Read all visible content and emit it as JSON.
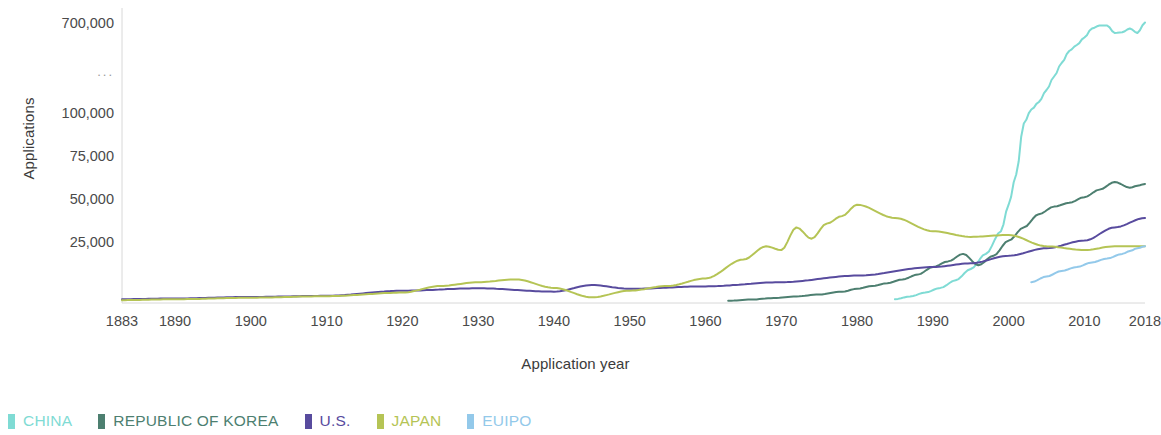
{
  "chart_data": {
    "type": "line",
    "title": "",
    "xlabel": "Application year",
    "ylabel": "Applications",
    "xlim": [
      1883,
      2018
    ],
    "ylim": [
      0,
      100000
    ],
    "y_axis_note": "broken axis: linear 0-100,000 then compressed jump to 700,000, break marked by ellipsis",
    "grid": false,
    "legend_position": "bottom-left",
    "xticks": [
      "1883",
      "1890",
      "1900",
      "1910",
      "1920",
      "1930",
      "1940",
      "1950",
      "1960",
      "1970",
      "1980",
      "1990",
      "2000",
      "2010",
      "2018"
    ],
    "xtick_values": [
      1883,
      1890,
      1900,
      1910,
      1920,
      1930,
      1940,
      1950,
      1960,
      1970,
      1980,
      1990,
      2000,
      2010,
      2018
    ],
    "yticks": [
      "700,000",
      "...",
      "100,000",
      "75,000",
      "50,000",
      "25,000"
    ],
    "ytick_values": [
      700000,
      null,
      100000,
      75000,
      50000,
      25000
    ],
    "series": [
      {
        "name": "CHINA",
        "color": "#7fdbd4",
        "x": [
          1985,
          1987,
          1989,
          1991,
          1993,
          1995,
          1997,
          1999,
          2000,
          2001,
          2002,
          2003,
          2004,
          2005,
          2006,
          2007,
          2008,
          2009,
          2010,
          2011,
          2012,
          2013,
          2014,
          2015,
          2016,
          2017,
          2018
        ],
        "y": [
          2000,
          3500,
          5500,
          8000,
          12000,
          18000,
          26000,
          38000,
          52000,
          68000,
          95000,
          130000,
          180000,
          260000,
          350000,
          440000,
          520000,
          560000,
          610000,
          670000,
          690000,
          690000,
          640000,
          645000,
          670000,
          640000,
          710000
        ]
      },
      {
        "name": "REPUBLIC OF KOREA",
        "color": "#4d7f70",
        "x": [
          1963,
          1966,
          1969,
          1972,
          1975,
          1978,
          1980,
          1982,
          1984,
          1986,
          1988,
          1990,
          1992,
          1994,
          1996,
          1998,
          2000,
          2002,
          2004,
          2006,
          2008,
          2010,
          2012,
          2014,
          2016,
          2017,
          2018
        ],
        "y": [
          1200,
          1800,
          2600,
          3500,
          4500,
          6000,
          7500,
          9000,
          10500,
          12500,
          15000,
          19000,
          22000,
          26000,
          20000,
          25000,
          33000,
          40000,
          47000,
          51000,
          53000,
          56000,
          60000,
          64000,
          61000,
          62000,
          63000
        ]
      },
      {
        "name": "U.S.",
        "color": "#584b9e",
        "x": [
          1883,
          1890,
          1900,
          1910,
          1920,
          1930,
          1940,
          1945,
          1950,
          1960,
          1970,
          1980,
          1990,
          1995,
          2000,
          2005,
          2010,
          2014,
          2018
        ],
        "y": [
          2000,
          2400,
          3200,
          3800,
          6500,
          7800,
          6000,
          9500,
          7500,
          8800,
          11000,
          14500,
          19000,
          21000,
          25000,
          29000,
          33000,
          40000,
          45000
        ]
      },
      {
        "name": "JAPAN",
        "color": "#b5c455",
        "x": [
          1883,
          1890,
          1900,
          1910,
          1920,
          1925,
          1930,
          1935,
          1940,
          1945,
          1950,
          1955,
          1960,
          1965,
          1968,
          1970,
          1972,
          1974,
          1976,
          1978,
          1980,
          1985,
          1990,
          1995,
          2000,
          2005,
          2010,
          2014,
          2018
        ],
        "y": [
          1500,
          2000,
          2800,
          3600,
          5500,
          9000,
          11000,
          12500,
          8000,
          3000,
          6500,
          9000,
          13000,
          23000,
          30000,
          28000,
          40000,
          34000,
          42000,
          46000,
          52000,
          45000,
          38000,
          35000,
          36000,
          30000,
          28000,
          30000,
          30000
        ]
      },
      {
        "name": "EUIPO",
        "color": "#93c9ea",
        "x": [
          2003,
          2005,
          2007,
          2009,
          2011,
          2013,
          2015,
          2016,
          2017,
          2018
        ],
        "y": [
          11000,
          14000,
          17000,
          19000,
          21500,
          23500,
          26000,
          27500,
          29000,
          30000
        ]
      }
    ]
  },
  "legend": {
    "items": [
      {
        "label": "CHINA",
        "color": "#7fdbd4"
      },
      {
        "label": "REPUBLIC OF KOREA",
        "color": "#4d7f70"
      },
      {
        "label": "U.S.",
        "color": "#584b9e"
      },
      {
        "label": "JAPAN",
        "color": "#b5c455"
      },
      {
        "label": "EUIPO",
        "color": "#93c9ea"
      }
    ]
  },
  "axes": {
    "y_title": "Applications",
    "x_title": "Application year"
  }
}
